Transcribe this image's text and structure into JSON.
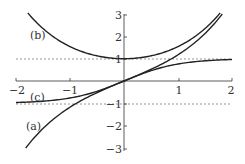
{
  "chart_data": {
    "type": "line",
    "title": "",
    "xlabel": "",
    "ylabel": "",
    "xlim": [
      -2,
      2
    ],
    "ylim": [
      -3,
      3
    ],
    "grid": false,
    "x_ticks": [
      -2,
      -1,
      1,
      2
    ],
    "x_tick_labels": [
      "−2",
      "−1",
      "1",
      "2"
    ],
    "y_ticks": [
      3,
      2,
      1,
      -1,
      -2,
      -3
    ],
    "y_tick_labels": [
      "3",
      "2",
      "1",
      "−1",
      "−2",
      "−3"
    ],
    "asymptotes": [
      {
        "y": 1,
        "style": "dashed"
      },
      {
        "y": -1,
        "style": "dashed"
      }
    ],
    "series": [
      {
        "name": "(a)",
        "function": "sinh(x)",
        "x": [
          -1.8,
          -1.5,
          -1,
          -0.5,
          0,
          0.5,
          1,
          1.5,
          1.8
        ],
        "values": [
          -2.94,
          -2.13,
          -1.18,
          -0.52,
          0,
          0.52,
          1.18,
          2.13,
          2.94
        ]
      },
      {
        "name": "(b)",
        "function": "cosh(x)",
        "x": [
          -1.8,
          -1.5,
          -1,
          -0.5,
          0,
          0.5,
          1,
          1.5,
          1.8
        ],
        "values": [
          3.11,
          2.35,
          1.54,
          1.13,
          1,
          1.13,
          1.54,
          2.35,
          3.11
        ]
      },
      {
        "name": "(c)",
        "function": "tanh(x)",
        "x": [
          -2,
          -1.5,
          -1,
          -0.5,
          0,
          0.5,
          1,
          1.5,
          2
        ],
        "values": [
          -0.96,
          -0.91,
          -0.76,
          -0.46,
          0,
          0.46,
          0.76,
          0.91,
          0.96
        ]
      }
    ],
    "annotations": [
      {
        "text": "(a)",
        "x": -1.55,
        "y": -2.0
      },
      {
        "text": "(b)",
        "x": -1.55,
        "y": 2.5
      },
      {
        "text": "(c)",
        "x": -1.55,
        "y": -0.6
      }
    ]
  },
  "labels": {
    "a": "(a)",
    "b": "(b)",
    "c": "(c)"
  }
}
